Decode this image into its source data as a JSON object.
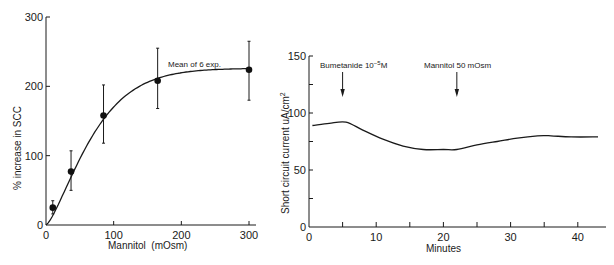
{
  "chart_data": [
    {
      "type": "scatter",
      "title": "",
      "xlabel": "Mannitol  (mOsm)",
      "ylabel": "% increase in SCC",
      "xlim": [
        0,
        300
      ],
      "ylim": [
        0,
        300
      ],
      "xticks": [
        0,
        100,
        200,
        300
      ],
      "yticks": [
        0,
        100,
        200,
        300
      ],
      "grid": false,
      "fit_curve": true,
      "annotation": "Mean of 6 exp.",
      "series": [
        {
          "name": "Mean of 6 exp.",
          "x": [
            10,
            37,
            85,
            165,
            300
          ],
          "y": [
            25,
            77,
            158,
            208,
            224
          ],
          "error_upper": [
            35,
            107,
            202,
            255,
            265
          ],
          "error_lower": [
            16,
            50,
            118,
            168,
            180
          ]
        }
      ]
    },
    {
      "type": "line",
      "title": "",
      "xlabel": "Minutes",
      "ylabel": "Short circuit current uA/cm2",
      "xlim": [
        0,
        44
      ],
      "ylim": [
        0,
        150
      ],
      "xticks": [
        0,
        10,
        20,
        30,
        40
      ],
      "yticks": [
        0,
        50,
        100,
        150
      ],
      "grid": false,
      "series": [
        {
          "name": "SCC",
          "x": [
            0.5,
            3,
            5.5,
            8,
            11,
            14,
            17,
            20,
            22,
            25,
            28,
            31,
            34,
            36,
            39,
            43
          ],
          "y": [
            89,
            91,
            92,
            85,
            77,
            71,
            68,
            68,
            68,
            72,
            75,
            78,
            80,
            80,
            79,
            79
          ]
        }
      ],
      "annotations": [
        {
          "label": "Bumetanide 10",
          "superscript": "−5",
          "suffix": "M",
          "x": 5
        },
        {
          "label": "Mannitol 50 mOsm",
          "x": 22
        }
      ]
    }
  ],
  "left": {
    "ylabel": "% increase in SCC",
    "xlabel": "Mannitol  (mOsm)",
    "annotation": "Mean of 6 exp.",
    "yticks": [
      "0",
      "100",
      "200",
      "300"
    ],
    "xticks": [
      "0",
      "100",
      "200",
      "300"
    ]
  },
  "right": {
    "ylabel": "Short circuit current uA/cm",
    "ylabel_sup": "2",
    "xlabel": "Minutes",
    "yticks": [
      "0",
      "50",
      "100",
      "150"
    ],
    "xticks": [
      "0",
      "10",
      "20",
      "30",
      "40"
    ],
    "annot1": "Bumetanide 10",
    "annot1_sup": "−5",
    "annot1_suffix": "M",
    "annot2": "Mannitol 50 mOsm"
  }
}
